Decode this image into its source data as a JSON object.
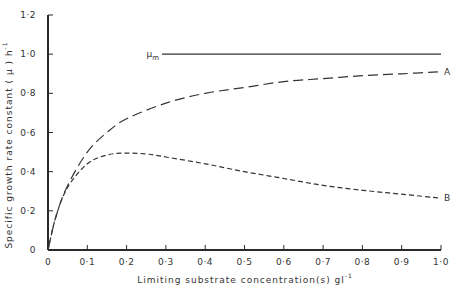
{
  "chart_data": {
    "type": "line",
    "title": "",
    "xlabel": "Limiting substrate concentration(s) gl",
    "xlabel_sup": "-1",
    "ylabel": "Specific growth rate constant ( μ ) h",
    "ylabel_sup": "-1",
    "xlim": [
      0,
      1.0
    ],
    "ylim": [
      0,
      1.2
    ],
    "x_ticks": [
      "0",
      "0·1",
      "0·2",
      "0·3",
      "0·4",
      "0·5",
      "0·6",
      "0·7",
      "0·8",
      "0·9",
      "1·0"
    ],
    "y_ticks": [
      "0",
      "0·2",
      "0·4",
      "0·6",
      "0·8",
      "1·0",
      "1·2"
    ],
    "grid": false,
    "series": [
      {
        "name": "μm",
        "label": "μ",
        "label_sub": "m",
        "style": "solid",
        "x": [
          0.29,
          1.0
        ],
        "y": [
          1.0,
          1.0
        ]
      },
      {
        "name": "A",
        "label": "A",
        "style": "long-dash",
        "x": [
          0,
          0.02,
          0.05,
          0.1,
          0.15,
          0.2,
          0.3,
          0.4,
          0.5,
          0.6,
          0.7,
          0.8,
          0.9,
          1.0
        ],
        "y": [
          0,
          0.17,
          0.33,
          0.5,
          0.6,
          0.67,
          0.75,
          0.8,
          0.83,
          0.86,
          0.875,
          0.89,
          0.9,
          0.91
        ]
      },
      {
        "name": "B",
        "label": "B",
        "style": "short-dash",
        "x": [
          0,
          0.02,
          0.05,
          0.1,
          0.15,
          0.2,
          0.25,
          0.3,
          0.4,
          0.5,
          0.6,
          0.7,
          0.8,
          0.9,
          1.0
        ],
        "y": [
          0,
          0.17,
          0.32,
          0.44,
          0.485,
          0.495,
          0.49,
          0.475,
          0.44,
          0.4,
          0.365,
          0.33,
          0.305,
          0.285,
          0.265
        ]
      }
    ]
  }
}
